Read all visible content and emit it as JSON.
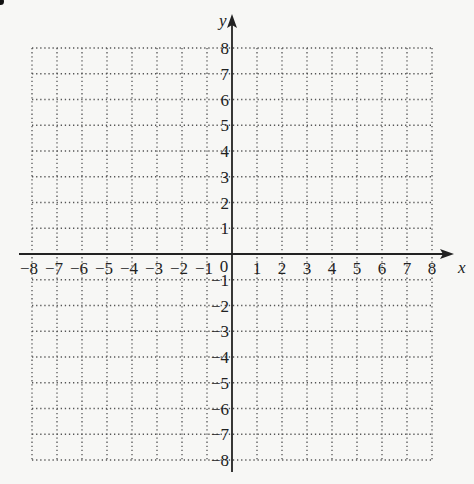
{
  "chart_data": {
    "type": "scatter",
    "title": "",
    "xlabel": "x",
    "ylabel": "y",
    "xlim": [
      -8,
      8
    ],
    "ylim": [
      -8,
      8
    ],
    "grid": true,
    "grid_style": "dotted",
    "x_ticks": [
      -8,
      -7,
      -6,
      -5,
      -4,
      -3,
      -2,
      -1,
      1,
      2,
      3,
      4,
      5,
      6,
      7,
      8
    ],
    "y_ticks": [
      -8,
      -7,
      -6,
      -5,
      -4,
      -3,
      -2,
      -1,
      1,
      2,
      3,
      4,
      5,
      6,
      7,
      8
    ],
    "origin_label": "0",
    "series": [],
    "legend": null
  },
  "colors": {
    "axis": "#222222",
    "grid": "#555555",
    "text": "#222222",
    "background": "#f7f7f5"
  }
}
